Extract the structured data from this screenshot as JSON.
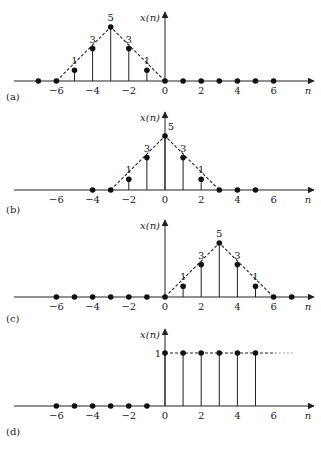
{
  "figure": {
    "n_zero_px": 165,
    "px_per_n": 18.1,
    "px_per_unit": 10.8,
    "axis_left_px": 14,
    "axis_right_px": 314,
    "y_axis_label": "x(n)",
    "x_axis_label": "n",
    "tick_values": [
      -6,
      -4,
      -2,
      0,
      2,
      4,
      6
    ],
    "tick_labels": [
      "−6",
      "−4",
      "−2",
      "0",
      "2",
      "4",
      "6"
    ]
  },
  "chart_data": [
    {
      "type": "stem",
      "panel": "(a)",
      "title": "",
      "xlabel": "n",
      "ylabel": "x(n)",
      "axis_y_px": 81,
      "yaxis_top_px": 12,
      "label_y_px": 100,
      "n": [
        -7,
        -6,
        -5,
        -4,
        -3,
        -2,
        -1,
        0,
        1,
        2,
        3,
        4,
        5,
        6
      ],
      "values": [
        0,
        0,
        1,
        3,
        5,
        3,
        1,
        0,
        0,
        0,
        0,
        0,
        0,
        0
      ],
      "value_labels": {
        "-5": "1",
        "-4": "3",
        "-3": "5",
        "-2": "3",
        "-1": "1"
      },
      "envelope": [
        [
          -6,
          0
        ],
        [
          -3,
          5
        ],
        [
          0,
          0
        ]
      ],
      "envelope_dashed": true
    },
    {
      "type": "stem",
      "panel": "(b)",
      "title": "",
      "xlabel": "n",
      "ylabel": "x(n)",
      "axis_y_px": 190,
      "yaxis_top_px": 112,
      "label_y_px": 213,
      "n": [
        -4,
        -3,
        -2,
        -1,
        0,
        1,
        2,
        3,
        4,
        5
      ],
      "values": [
        0,
        0,
        1,
        3,
        5,
        3,
        1,
        0,
        0,
        0
      ],
      "value_labels": {
        "-2": "1",
        "-1": "3",
        "0": "5",
        "1": "3",
        "2": "1"
      },
      "envelope": [
        [
          -3,
          0
        ],
        [
          0,
          5
        ],
        [
          3,
          0
        ]
      ],
      "envelope_dashed": true
    },
    {
      "type": "stem",
      "panel": "(c)",
      "title": "",
      "xlabel": "n",
      "ylabel": "x(n)",
      "axis_y_px": 297,
      "yaxis_top_px": 220,
      "label_y_px": 322,
      "n": [
        -6,
        -5,
        -4,
        -3,
        -2,
        -1,
        0,
        1,
        2,
        3,
        4,
        5,
        6,
        7
      ],
      "values": [
        0,
        0,
        0,
        0,
        0,
        0,
        0,
        1,
        3,
        5,
        3,
        1,
        0,
        0
      ],
      "value_labels": {
        "1": "1",
        "2": "3",
        "3": "5",
        "4": "3",
        "5": "1"
      },
      "envelope": [
        [
          0,
          0
        ],
        [
          3,
          5
        ],
        [
          6,
          0
        ]
      ],
      "envelope_dashed": true
    },
    {
      "type": "stem",
      "panel": "(d)",
      "title": "",
      "xlabel": "n",
      "ylabel": "x(n)",
      "axis_y_px": 406,
      "yaxis_top_px": 329,
      "label_y_px": 435,
      "unit_px": 53,
      "n": [
        -6,
        -5,
        -4,
        -3,
        -2,
        -1,
        0,
        1,
        2,
        3,
        4,
        5
      ],
      "values": [
        0,
        0,
        0,
        0,
        0,
        0,
        1,
        1,
        1,
        1,
        1,
        1
      ],
      "value_labels": {},
      "level_label": "1",
      "envelope": [
        [
          0,
          1
        ],
        [
          6.1,
          1
        ]
      ],
      "envelope_dashed": true,
      "continuation_dotted": [
        [
          6.1,
          1
        ],
        [
          7.2,
          1
        ]
      ]
    }
  ]
}
